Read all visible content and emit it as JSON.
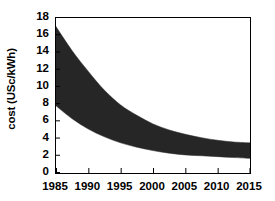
{
  "chart_data": {
    "type": "area",
    "title": "",
    "xlabel": "",
    "ylabel": "cost (USc/kWh)",
    "xlim": [
      1985,
      2015
    ],
    "ylim": [
      0,
      18
    ],
    "ytick_values": [
      0,
      2,
      4,
      6,
      8,
      10,
      12,
      14,
      16,
      18
    ],
    "ytick_labels": [
      "0",
      "2",
      "4",
      "6",
      "8",
      "10",
      "12",
      "14",
      "16",
      "18"
    ],
    "xtick_values": [
      1985,
      1990,
      1995,
      2000,
      2005,
      2010,
      2015
    ],
    "xtick_labels": [
      "1985",
      "1990",
      "1995",
      "2000",
      "2005",
      "2010",
      "2015"
    ],
    "grid": false,
    "legend": "none",
    "band_color": "#262626",
    "frame_color": "#000000",
    "background_color": "#ffffff",
    "x": [
      1985,
      1987.5,
      1990,
      1992.5,
      1995,
      1997.5,
      2000,
      2002.5,
      2005,
      2007.5,
      2010,
      2012.5,
      2015
    ],
    "series": [
      {
        "name": "upper bound",
        "values": [
          17.0,
          14.2,
          11.8,
          9.6,
          7.9,
          6.7,
          5.7,
          5.0,
          4.5,
          4.1,
          3.8,
          3.6,
          3.5
        ]
      },
      {
        "name": "lower bound",
        "values": [
          7.8,
          6.3,
          5.1,
          4.2,
          3.5,
          3.0,
          2.6,
          2.3,
          2.1,
          2.0,
          1.9,
          1.8,
          1.7
        ]
      }
    ],
    "annotations": []
  }
}
